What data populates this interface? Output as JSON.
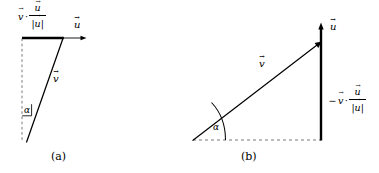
{
  "figure": {
    "background_color": "#ffffff",
    "stroke_color": "#000000",
    "width": 379,
    "height": 173
  },
  "panel_a": {
    "caption": "(a)",
    "labels": {
      "projection": {
        "vec_v": "v",
        "dot": "·",
        "numerator": "u",
        "denominator": "|u|"
      },
      "u_axis": "u",
      "v_vector": "v",
      "angle": "α"
    },
    "geometry": {
      "proj_segment": {
        "x1": 22,
        "y1": 38,
        "x2": 63,
        "y2": 38
      },
      "u_arrow": {
        "x1": 63,
        "y1": 38,
        "x2": 86,
        "y2": 38
      },
      "dashed_vertical": {
        "x1": 22,
        "y1": 38,
        "x2": 22,
        "y2": 141
      },
      "v_vector": {
        "x1": 27,
        "y1": 141,
        "x2": 63,
        "y2": 38
      },
      "angle_mark": {
        "x": 24,
        "y": 106
      }
    }
  },
  "panel_b": {
    "caption": "(b)",
    "labels": {
      "u_axis": "u",
      "v_vector": "v",
      "projection": {
        "minus": "−",
        "vec_v": "v",
        "dot": "·",
        "numerator": "u",
        "denominator": "|u|"
      },
      "angle": "α"
    },
    "geometry": {
      "dashed_baseline": {
        "x1": 193,
        "y1": 140,
        "x2": 321,
        "y2": 140
      },
      "u_vertical": {
        "x1": 321,
        "y1": 140,
        "x2": 321,
        "y2": 24
      },
      "v_vector": {
        "x1": 193,
        "y1": 140,
        "x2": 321,
        "y2": 42
      },
      "angle_arc": {
        "cx": 193,
        "cy": 140,
        "r": 32
      }
    }
  }
}
